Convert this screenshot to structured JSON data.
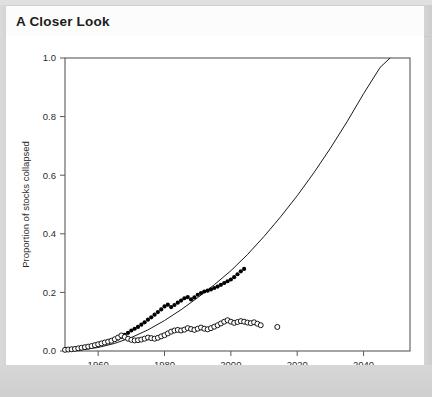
{
  "panel": {
    "title": "A Closer Look"
  },
  "chart_data": {
    "type": "scatter",
    "title": "",
    "xlabel": "Year",
    "ylabel": "Proportion of stocks collapsed",
    "xlim": [
      1950,
      2054
    ],
    "ylim": [
      0.0,
      1.0
    ],
    "grid": false,
    "legend_position": "none",
    "xticks": [
      1960,
      1980,
      2000,
      2020,
      2040
    ],
    "xtick_labels": [
      "1960",
      "1980",
      "2000",
      "2020",
      "2040"
    ],
    "yticks": [
      0.0,
      0.2,
      0.4,
      0.6,
      0.8,
      1.0
    ],
    "ytick_labels": [
      "0.0",
      "0.2",
      "0.4",
      "0.6",
      "0.8",
      "1.0"
    ],
    "series": [
      {
        "name": "cumulative-collapsed-filled",
        "marker": "filled-circle",
        "color": "#000000",
        "points": [
          [
            1950,
            0.004
          ],
          [
            1951,
            0.005
          ],
          [
            1952,
            0.006
          ],
          [
            1953,
            0.007
          ],
          [
            1954,
            0.008
          ],
          [
            1955,
            0.01
          ],
          [
            1956,
            0.012
          ],
          [
            1957,
            0.014
          ],
          [
            1958,
            0.016
          ],
          [
            1959,
            0.019
          ],
          [
            1960,
            0.022
          ],
          [
            1961,
            0.025
          ],
          [
            1962,
            0.028
          ],
          [
            1963,
            0.031
          ],
          [
            1964,
            0.034
          ],
          [
            1965,
            0.038
          ],
          [
            1966,
            0.043
          ],
          [
            1967,
            0.049
          ],
          [
            1968,
            0.055
          ],
          [
            1969,
            0.062
          ],
          [
            1970,
            0.07
          ],
          [
            1971,
            0.076
          ],
          [
            1972,
            0.082
          ],
          [
            1973,
            0.09
          ],
          [
            1974,
            0.098
          ],
          [
            1975,
            0.107
          ],
          [
            1976,
            0.115
          ],
          [
            1977,
            0.124
          ],
          [
            1978,
            0.133
          ],
          [
            1979,
            0.142
          ],
          [
            1980,
            0.152
          ],
          [
            1981,
            0.158
          ],
          [
            1982,
            0.15
          ],
          [
            1983,
            0.157
          ],
          [
            1984,
            0.165
          ],
          [
            1985,
            0.172
          ],
          [
            1986,
            0.18
          ],
          [
            1987,
            0.184
          ],
          [
            1988,
            0.176
          ],
          [
            1989,
            0.183
          ],
          [
            1990,
            0.192
          ],
          [
            1991,
            0.198
          ],
          [
            1992,
            0.203
          ],
          [
            1993,
            0.206
          ],
          [
            1994,
            0.21
          ],
          [
            1995,
            0.215
          ],
          [
            1996,
            0.22
          ],
          [
            1997,
            0.226
          ],
          [
            1998,
            0.232
          ],
          [
            1999,
            0.238
          ],
          [
            2000,
            0.244
          ],
          [
            2001,
            0.252
          ],
          [
            2002,
            0.262
          ],
          [
            2003,
            0.272
          ],
          [
            2004,
            0.28
          ]
        ]
      },
      {
        "name": "currently-collapsed-open",
        "marker": "open-circle",
        "color": "#000000",
        "points": [
          [
            1950,
            0.004
          ],
          [
            1951,
            0.005
          ],
          [
            1952,
            0.006
          ],
          [
            1953,
            0.007
          ],
          [
            1954,
            0.009
          ],
          [
            1955,
            0.011
          ],
          [
            1956,
            0.013
          ],
          [
            1957,
            0.015
          ],
          [
            1958,
            0.017
          ],
          [
            1959,
            0.02
          ],
          [
            1960,
            0.023
          ],
          [
            1961,
            0.026
          ],
          [
            1962,
            0.029
          ],
          [
            1963,
            0.032
          ],
          [
            1964,
            0.035
          ],
          [
            1965,
            0.04
          ],
          [
            1966,
            0.046
          ],
          [
            1967,
            0.053
          ],
          [
            1968,
            0.048
          ],
          [
            1969,
            0.042
          ],
          [
            1970,
            0.038
          ],
          [
            1971,
            0.036
          ],
          [
            1972,
            0.037
          ],
          [
            1973,
            0.039
          ],
          [
            1974,
            0.042
          ],
          [
            1975,
            0.046
          ],
          [
            1976,
            0.044
          ],
          [
            1977,
            0.042
          ],
          [
            1978,
            0.045
          ],
          [
            1979,
            0.05
          ],
          [
            1980,
            0.054
          ],
          [
            1981,
            0.06
          ],
          [
            1982,
            0.066
          ],
          [
            1983,
            0.07
          ],
          [
            1984,
            0.072
          ],
          [
            1985,
            0.07
          ],
          [
            1986,
            0.073
          ],
          [
            1987,
            0.078
          ],
          [
            1988,
            0.075
          ],
          [
            1989,
            0.072
          ],
          [
            1990,
            0.076
          ],
          [
            1991,
            0.08
          ],
          [
            1992,
            0.076
          ],
          [
            1993,
            0.074
          ],
          [
            1994,
            0.078
          ],
          [
            1995,
            0.083
          ],
          [
            1996,
            0.088
          ],
          [
            1997,
            0.094
          ],
          [
            1998,
            0.1
          ],
          [
            1999,
            0.105
          ],
          [
            2000,
            0.1
          ],
          [
            2001,
            0.096
          ],
          [
            2002,
            0.099
          ],
          [
            2003,
            0.102
          ],
          [
            2004,
            0.1
          ],
          [
            2005,
            0.097
          ],
          [
            2006,
            0.095
          ],
          [
            2007,
            0.098
          ],
          [
            2008,
            0.093
          ],
          [
            2009,
            0.088
          ],
          [
            2014,
            0.082
          ]
        ]
      }
    ],
    "fit_curve": {
      "name": "projected-collapse-trend",
      "style": "solid-thin-line",
      "color": "#000000",
      "points": [
        [
          1950,
          0.0
        ],
        [
          1955,
          0.004
        ],
        [
          1960,
          0.012
        ],
        [
          1965,
          0.026
        ],
        [
          1970,
          0.046
        ],
        [
          1975,
          0.072
        ],
        [
          1980,
          0.104
        ],
        [
          1985,
          0.141
        ],
        [
          1990,
          0.182
        ],
        [
          1995,
          0.226
        ],
        [
          2000,
          0.274
        ],
        [
          2005,
          0.329
        ],
        [
          2010,
          0.391
        ],
        [
          2015,
          0.458
        ],
        [
          2020,
          0.53
        ],
        [
          2025,
          0.608
        ],
        [
          2030,
          0.692
        ],
        [
          2035,
          0.782
        ],
        [
          2040,
          0.878
        ],
        [
          2045,
          0.968
        ],
        [
          2048,
          1.0
        ]
      ]
    }
  }
}
